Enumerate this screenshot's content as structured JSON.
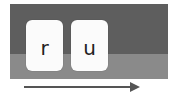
{
  "diagram": {
    "keys": [
      {
        "label": "r"
      },
      {
        "label": "u"
      }
    ],
    "arrow": {
      "direction": "right"
    },
    "colors": {
      "band_top": "#5e5e5e",
      "band_bottom": "#8a8a8a",
      "key_face": "#fbfbfb",
      "arrow": "#555555"
    }
  }
}
